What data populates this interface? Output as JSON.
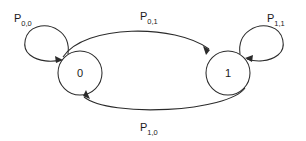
{
  "diagram": {
    "type": "state-transition-diagram",
    "title": "",
    "background_color": "#ffffff",
    "line_color": "#2b2b2b",
    "text_color": "#1a1a1a",
    "nodes": [
      {
        "id": "0",
        "label": "0",
        "cx": 80,
        "cy": 73,
        "r": 22
      },
      {
        "id": "1",
        "label": "1",
        "cx": 228,
        "cy": 73,
        "r": 22
      }
    ],
    "edges": [
      {
        "id": "p00",
        "from": "0",
        "to": "0",
        "kind": "self-loop",
        "label_base": "P",
        "label_sub": "0,0",
        "label_x": 14,
        "label_y": 22
      },
      {
        "id": "p01",
        "from": "0",
        "to": "1",
        "kind": "arc-top",
        "label_base": "P",
        "label_sub": "0,1",
        "label_x": 140,
        "label_y": 20
      },
      {
        "id": "p11",
        "from": "1",
        "to": "1",
        "kind": "self-loop",
        "label_base": "P",
        "label_sub": "1,1",
        "label_x": 267,
        "label_y": 22
      },
      {
        "id": "p10",
        "from": "1",
        "to": "0",
        "kind": "arc-bottom",
        "label_base": "P",
        "label_sub": "1,0",
        "label_x": 140,
        "label_y": 131
      }
    ]
  }
}
